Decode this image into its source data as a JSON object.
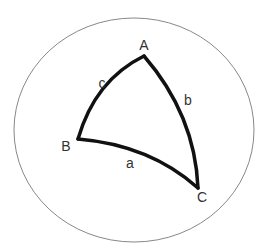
{
  "diagram": {
    "sphere": {
      "cx": 134,
      "cy": 130,
      "rx": 120,
      "ry": 112,
      "stroke": "#888888"
    },
    "vertices": [
      {
        "name": "A",
        "x": 144,
        "y": 56,
        "label_x": 144,
        "label_y": 45
      },
      {
        "name": "B",
        "x": 78,
        "y": 139,
        "label_x": 66,
        "label_y": 146
      },
      {
        "name": "C",
        "x": 198,
        "y": 188,
        "label_x": 202,
        "label_y": 197
      }
    ],
    "sides": [
      {
        "name": "a",
        "label_x": 130,
        "label_y": 163
      },
      {
        "name": "b",
        "label_x": 188,
        "label_y": 100
      },
      {
        "name": "c",
        "label_x": 102,
        "label_y": 83
      }
    ],
    "triangle_stroke": "#111111"
  }
}
